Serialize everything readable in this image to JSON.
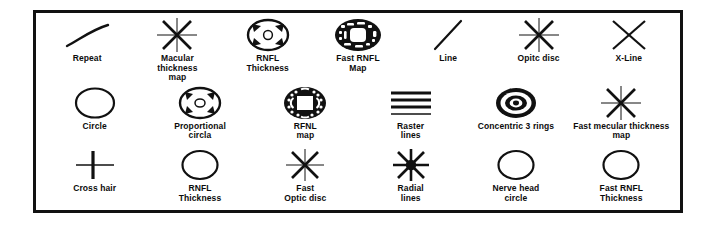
{
  "figure": {
    "name": "oct-scan-pattern-legend",
    "background": "#ffffff",
    "ink": "#111111",
    "border_color": "#111111"
  },
  "rows": [
    {
      "items": [
        {
          "label": "Repeat",
          "icon": "arc-curve-icon"
        },
        {
          "label": "Macular\nthickness\nmap",
          "icon": "eight-spoke-asterisk-icon"
        },
        {
          "label": "RNFL\nThickness",
          "icon": "ellipse-inward-arrows-icon"
        },
        {
          "label": "Fast RNFL\nMap",
          "icon": "filled-ellipse-dashed-map-icon"
        },
        {
          "label": "Line",
          "icon": "diagonal-line-icon"
        },
        {
          "label": "Opitc disc",
          "icon": "eight-spoke-asterisk-icon"
        },
        {
          "label": "X-Line",
          "icon": "x-cross-icon"
        }
      ]
    },
    {
      "items": [
        {
          "label": "Circle",
          "icon": "circle-outline-icon"
        },
        {
          "label": "Proportional\ncircla",
          "icon": "ellipse-outward-arrows-icon"
        },
        {
          "label": "RFNL\nmap",
          "icon": "filled-circle-square-map-icon"
        },
        {
          "label": "Raster\nlines",
          "icon": "raster-lines-icon"
        },
        {
          "label": "Concentric 3 rings",
          "icon": "bullseye-three-rings-icon"
        },
        {
          "label": "Fast mecular thickness\nmap",
          "icon": "eight-spoke-asterisk-icon"
        }
      ]
    },
    {
      "items": [
        {
          "label": "Cross hair",
          "icon": "cross-hair-icon"
        },
        {
          "label": "RNFL\nThickness",
          "icon": "circle-outline-icon"
        },
        {
          "label": "Fast\nOptic disc",
          "icon": "eight-spoke-asterisk-icon"
        },
        {
          "label": "Radial\nlines",
          "icon": "radial-lines-filled-hub-icon"
        },
        {
          "label": "Nerve head\ncircle",
          "icon": "circle-outline-icon"
        },
        {
          "label": "Fast RNFL\nThickness",
          "icon": "circle-outline-icon"
        }
      ]
    }
  ]
}
